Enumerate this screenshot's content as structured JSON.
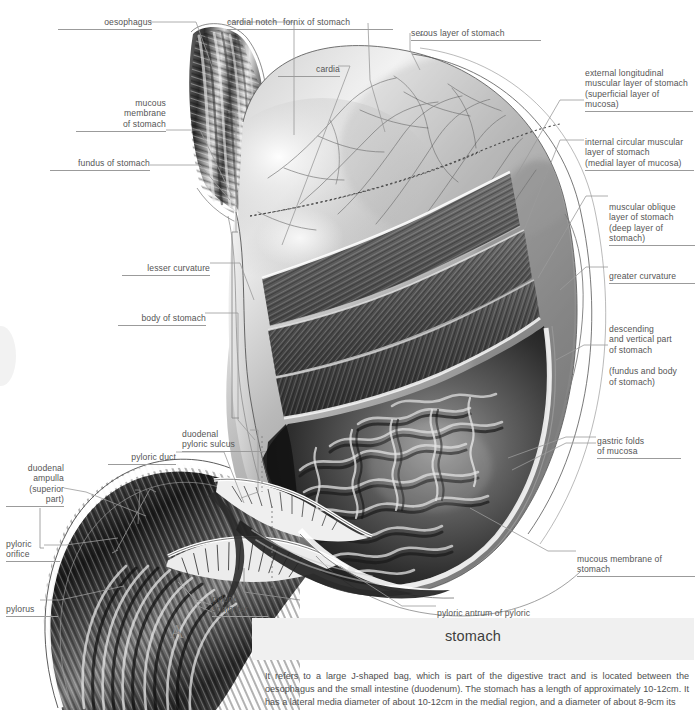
{
  "figure": {
    "marker": "A",
    "title": "stomach",
    "description": "It refers to a large J-shaped bag, which is part of the digestive tract and is located between the oesophagus and the small intestine (duodenum). The stomach has a length of approximately 10-12cm. It has a lateral media diameter of about 10-12cm in the medial region, and a diameter of about 8-9cm its"
  },
  "labels": {
    "oesophagus": "oesophagus",
    "cardial_notch": "cardial notch",
    "fornix_of_stomach": "fornix of stomach",
    "serous_layer": "serous layer of stomach",
    "cardia": "cardia",
    "mucous_membrane_l1": "mucous",
    "mucous_membrane_l2": "membrane",
    "mucous_membrane_l3": "of stomach",
    "fundus_of_stomach": "fundus of stomach",
    "lesser_curvature": "lesser curvature",
    "body_of_stomach": "body of stomach",
    "duodenal_pyloric_sulcus_l1": "duodenal",
    "duodenal_pyloric_sulcus_l2": "pyloric sulcus",
    "pyloric_duct": "pyloric duct",
    "duodenal_ampulla_l1": "duodenal",
    "duodenal_ampulla_l2": "ampulla",
    "duodenal_ampulla_l3": "(superior",
    "duodenal_ampulla_l4": "part)",
    "pyloric_orifice_l1": "pyloric",
    "pyloric_orifice_l2": "orifice",
    "pylorus": "pylorus",
    "pyloric_sphincter_l1": "pyloric",
    "pyloric_sphincter_l2": "sphincter",
    "pyloric_antrum_l1": "pyloric antrum of pyloric",
    "pyloric_antrum_l2": "and horizontal part of stomach",
    "external_longitudinal_l1": "external longitudinal",
    "external_longitudinal_l2": "muscular layer of stomach",
    "external_longitudinal_l3": "(superficial layer of mucosa)",
    "internal_circular_l1": "internal circular muscular",
    "internal_circular_l2": "layer of stomach",
    "internal_circular_l3": "(medial layer of mucosa)",
    "muscular_oblique_l1": "muscular oblique",
    "muscular_oblique_l2": "layer of stomach",
    "muscular_oblique_l3": "(deep layer of",
    "muscular_oblique_l4": "stomach)",
    "greater_curvature": "greater curvature",
    "descending_vertical_l1": "descending",
    "descending_vertical_l2": "and vertical part",
    "descending_vertical_l3": "of stomach",
    "descending_vertical_l4": "(fundus and body",
    "descending_vertical_l5": "of stomach)",
    "gastric_folds_l1": "gastric folds",
    "gastric_folds_l2": "of mucosa",
    "mucous_membrane_of_stomach": "mucous membrane of stomach"
  },
  "colors": {
    "leader": "#9b9b9b",
    "text": "#555555",
    "caption_band": "#f0f0f0",
    "background": "#ffffff"
  }
}
